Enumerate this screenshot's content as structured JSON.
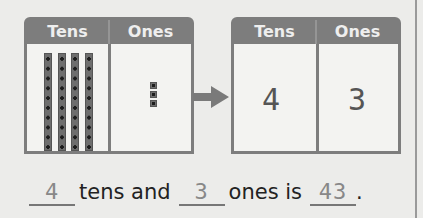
{
  "left_chart": {
    "headers": [
      "Tens",
      "Ones"
    ],
    "tens_rods": 4,
    "ones_cubes": 3
  },
  "right_chart": {
    "headers": [
      "Tens",
      "Ones"
    ],
    "tens_value": "4",
    "ones_value": "3"
  },
  "sentence": {
    "blank1": "4",
    "text1": "tens and",
    "blank2": "3",
    "text2": "ones is",
    "blank3": "43",
    "end": "."
  },
  "colors": {
    "header_gray": "#7d7d7d",
    "background": "#ececea"
  }
}
